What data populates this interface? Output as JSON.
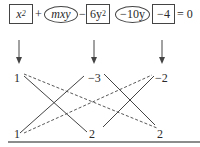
{
  "equation": {
    "terms": [
      {
        "text": "x",
        "sup": "2",
        "shape": "box"
      },
      {
        "text": "mxy",
        "shape": "oval"
      },
      {
        "text": "6y",
        "sup": "2",
        "shape": "box"
      },
      {
        "text": "−10y",
        "shape": "oval"
      },
      {
        "text": "−4",
        "shape": "box"
      }
    ],
    "operators": [
      "+",
      "−",
      "= 0"
    ]
  },
  "factors": {
    "top": [
      "1",
      "−3",
      "−2"
    ],
    "bottom": [
      "1",
      "2",
      "2"
    ]
  },
  "colors": {
    "stroke": "#444444",
    "text": "#2a2a2a",
    "baseline": "#666666"
  }
}
